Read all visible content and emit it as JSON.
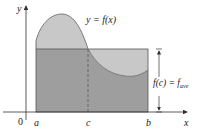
{
  "figure": {
    "type": "mean-value-theorem-integrals",
    "labels": {
      "y_axis": "y",
      "x_axis": "x",
      "origin": "0",
      "a": "a",
      "c": "c",
      "b": "b",
      "curve": "y = f(x)",
      "fc": "f(c) = f",
      "fave_sub": "ave"
    },
    "colors": {
      "background": "#ffffff",
      "rectangle_fill": "#9e9e9e",
      "curve_region_fill": "#c8c8c8",
      "curve_stroke": "#7a7a7a",
      "axis": "#333333",
      "rectangle_stroke": "#555555"
    }
  }
}
